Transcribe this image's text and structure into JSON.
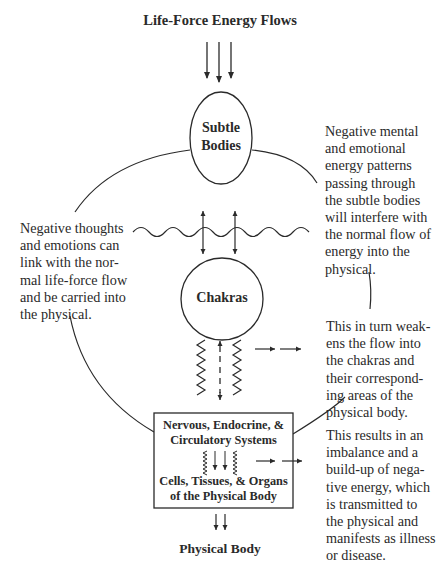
{
  "title": "Life-Force Energy Flows",
  "nodes": {
    "subtle_bodies": "Subtle\nBodies",
    "chakras": "Chakras",
    "systems": "Nervous, Endocrine, &\nCirculatory Systems",
    "cells": "Cells, Tissues, & Organs\nof the Physical Body",
    "physical_body": "Physical Body"
  },
  "annotations": {
    "right_top": "Negative mental\nand emotional\nenergy patterns\npassing through\nthe subtle bodies\nwill interfere with\nthe normal flow of\nenergy into the\nphysical.",
    "left": "Negative thoughts\nand emotions can\nlink with the nor-\nmal life-force flow\nand be carried into\nthe physical.",
    "right_middle": "This in turn weak-\nens the flow into\nthe chakras and\ntheir correspond-\ning areas of the\nphysical body.",
    "right_bottom": "This results in an\nimbalance and a\nbuild-up of nega-\ntive energy, which\nis transmitted to\nthe physical and\nmanifests as illness\nor disease."
  },
  "colors": {
    "line": "#2a2a2a",
    "background": "#ffffff"
  }
}
